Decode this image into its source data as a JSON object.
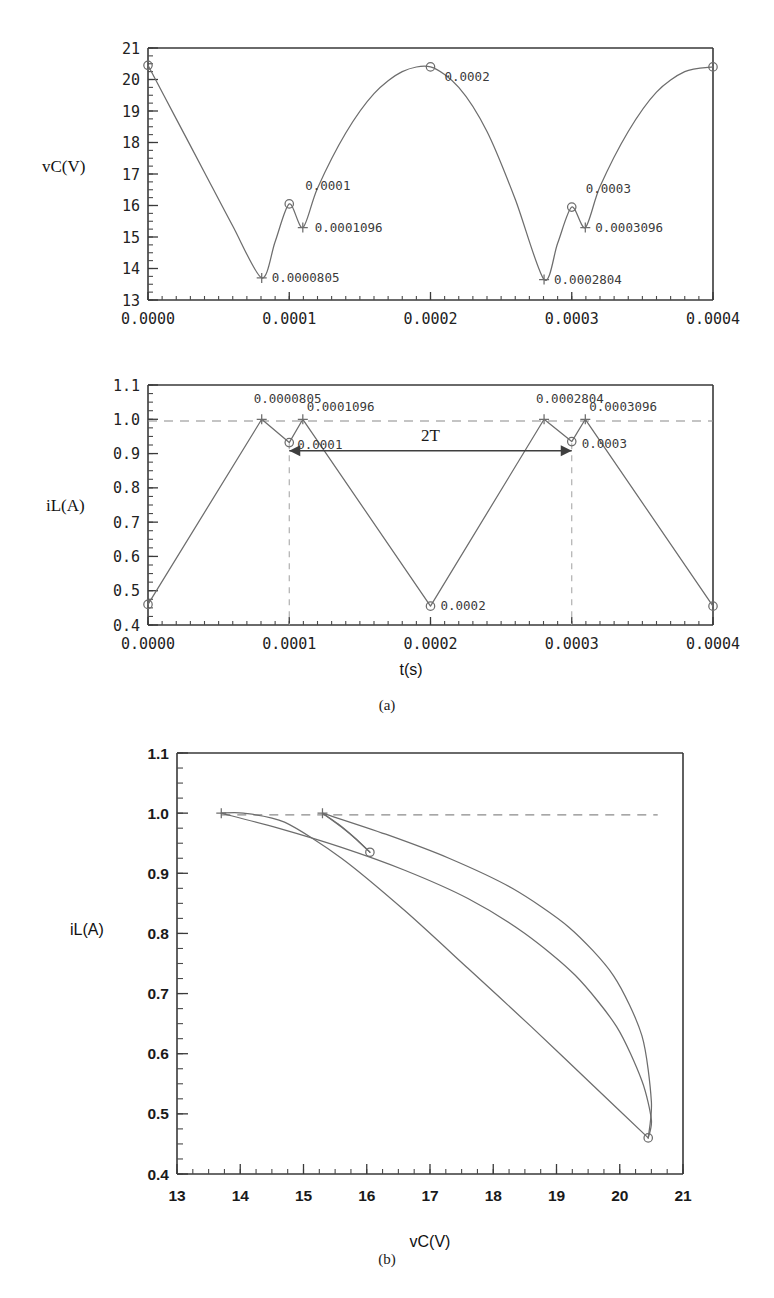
{
  "figure": {
    "captions": [
      {
        "id": "caption-a",
        "text": "(a)"
      },
      {
        "id": "caption-b",
        "text": "(b)"
      }
    ]
  },
  "chart_data": [
    {
      "id": "vc-time",
      "type": "line",
      "title": "",
      "xlabel": "",
      "ylabel": "vC(V)",
      "xlim": [
        0.0,
        0.0004
      ],
      "ylim": [
        13,
        21
      ],
      "grid": false,
      "legend": "none",
      "xticks": [
        "0.0000",
        "0.0001",
        "0.0002",
        "0.0003",
        "0.0004"
      ],
      "xtick_values": [
        0.0,
        0.0001,
        0.0002,
        0.0003,
        0.0004
      ],
      "yticks": [
        "13",
        "14",
        "15",
        "16",
        "17",
        "18",
        "19",
        "20",
        "21"
      ],
      "ytick_values": [
        13,
        14,
        15,
        16,
        17,
        18,
        19,
        20,
        21
      ],
      "x": [
        0.0,
        2e-05,
        4e-05,
        6e-05,
        8.05e-05,
        9e-05,
        0.0001,
        0.0001096,
        0.00012,
        0.00014,
        0.00016,
        0.00018,
        0.0002,
        0.00022,
        0.00024,
        0.00026,
        0.0002804,
        0.00029,
        0.0003,
        0.0003096,
        0.00032,
        0.00034,
        0.00036,
        0.00038,
        0.0004
      ],
      "y": [
        20.45,
        18.75,
        17.05,
        15.35,
        13.7,
        14.85,
        16.05,
        15.3,
        16.55,
        18.3,
        19.55,
        20.25,
        20.4,
        19.75,
        18.35,
        16.2,
        13.65,
        14.8,
        15.95,
        15.3,
        16.6,
        18.35,
        19.6,
        20.25,
        20.4
      ],
      "annotations": [
        {
          "label": "0.0001",
          "x": 0.0001,
          "y": 16.05,
          "marker": "circle",
          "label_dx": 16,
          "label_dy": -14
        },
        {
          "label": "0.0001096",
          "x": 0.0001096,
          "y": 15.3,
          "marker": "plus",
          "label_dx": 12,
          "label_dy": 4
        },
        {
          "label": "0.0000805",
          "x": 8.05e-05,
          "y": 13.7,
          "marker": "plus",
          "label_dx": 10,
          "label_dy": 4
        },
        {
          "label": "0.0002",
          "x": 0.0002,
          "y": 20.4,
          "marker": "circle",
          "label_dx": 14,
          "label_dy": 14
        },
        {
          "label": "0.0003",
          "x": 0.0003,
          "y": 15.95,
          "marker": "circle",
          "label_dx": 14,
          "label_dy": -14
        },
        {
          "label": "0.0003096",
          "x": 0.0003096,
          "y": 15.3,
          "marker": "plus",
          "label_dx": 10,
          "label_dy": 4
        },
        {
          "label": "0.0002804",
          "x": 0.0002804,
          "y": 13.65,
          "marker": "plus",
          "label_dx": 10,
          "label_dy": 4
        }
      ],
      "start_marker": {
        "x": 0.0,
        "y": 20.45,
        "marker": "circle"
      },
      "end_marker": {
        "x": 0.0004,
        "y": 20.4,
        "marker": "circle"
      }
    },
    {
      "id": "il-time",
      "type": "line",
      "title": "",
      "xlabel": "t(s)",
      "ylabel": "iL(A)",
      "xlim": [
        0.0,
        0.0004
      ],
      "ylim": [
        0.4,
        1.1
      ],
      "grid": false,
      "legend": "none",
      "xticks": [
        "0.0000",
        "0.0001",
        "0.0002",
        "0.0003",
        "0.0004"
      ],
      "xtick_values": [
        0.0,
        0.0001,
        0.0002,
        0.0003,
        0.0004
      ],
      "yticks": [
        "0.4",
        "0.5",
        "0.6",
        "0.7",
        "0.8",
        "0.9",
        "1.0",
        "1.1"
      ],
      "ytick_values": [
        0.4,
        0.5,
        0.6,
        0.7,
        0.8,
        0.9,
        1.0,
        1.1
      ],
      "x": [
        0.0,
        8.05e-05,
        0.0001,
        0.0001096,
        0.0002,
        0.0002804,
        0.0003,
        0.0003096,
        0.0004
      ],
      "y": [
        0.46,
        1.0,
        0.932,
        1.0,
        0.455,
        1.0,
        0.935,
        1.0,
        0.455
      ],
      "reference_line": {
        "y": 0.995,
        "style": "dashed"
      },
      "vertical_guides": [
        0.0001,
        0.0003
      ],
      "annotations": [
        {
          "label": "0.0000805",
          "x": 8.05e-05,
          "y": 1.0,
          "marker": "plus",
          "label_dx": -8,
          "label_dy": -16
        },
        {
          "label": "0.0001096",
          "x": 0.0001096,
          "y": 1.0,
          "marker": "plus",
          "label_dx": 4,
          "label_dy": -8
        },
        {
          "label": "0.0001",
          "x": 0.0001,
          "y": 0.932,
          "marker": "circle",
          "label_dx": 8,
          "label_dy": 6
        },
        {
          "label": "0.0002",
          "x": 0.0002,
          "y": 0.455,
          "marker": "circle",
          "label_dx": 10,
          "label_dy": 4
        },
        {
          "label": "0.0002804",
          "x": 0.0002804,
          "y": 1.0,
          "marker": "plus",
          "label_dx": -8,
          "label_dy": -16
        },
        {
          "label": "0.0003096",
          "x": 0.0003096,
          "y": 1.0,
          "marker": "plus",
          "label_dx": 4,
          "label_dy": -8
        },
        {
          "label": "0.0003",
          "x": 0.0003,
          "y": 0.935,
          "marker": "circle",
          "label_dx": 10,
          "label_dy": 6
        }
      ],
      "span_annotation": {
        "label": "2T",
        "x_start": 0.0001,
        "x_end": 0.0003,
        "y": 0.908,
        "arrows": "both"
      },
      "start_marker": {
        "x": 0.0,
        "y": 0.46,
        "marker": "circle"
      },
      "end_marker": {
        "x": 0.0004,
        "y": 0.455,
        "marker": "circle"
      }
    },
    {
      "id": "phase-portrait",
      "type": "line",
      "title": "",
      "xlabel": "vC(V)",
      "ylabel": "iL(A)",
      "xlim": [
        13,
        21
      ],
      "ylim": [
        0.4,
        1.1
      ],
      "grid": false,
      "legend": "none",
      "xticks": [
        "13",
        "14",
        "15",
        "16",
        "17",
        "18",
        "19",
        "20",
        "21"
      ],
      "xtick_values": [
        13,
        14,
        15,
        16,
        17,
        18,
        19,
        20,
        21
      ],
      "yticks": [
        "0.4",
        "0.5",
        "0.6",
        "0.7",
        "0.8",
        "0.9",
        "1.0",
        "1.1"
      ],
      "ytick_values": [
        0.4,
        0.5,
        0.6,
        0.7,
        0.8,
        0.9,
        1.0,
        1.1
      ],
      "reference_line": {
        "y": 0.997,
        "x_start": 13.7,
        "x_end": 20.6,
        "style": "dashed"
      },
      "series": [
        {
          "name": "charge-ramp",
          "comment": "rising ramp from low-iL corner back up to vC=13.7 at iL=1.0",
          "x": [
            20.45,
            19.6,
            18.6,
            17.6,
            16.6,
            15.6,
            14.7,
            14.05,
            13.7
          ],
          "y": [
            0.46,
            0.545,
            0.645,
            0.742,
            0.838,
            0.925,
            0.985,
            1.0,
            1.0
          ]
        },
        {
          "name": "discharge-arc",
          "comment": "long curved discharge from vC=13.7,iL=1.0 out to vC=20.45,iL=0.46",
          "x": [
            13.7,
            14.6,
            15.6,
            16.6,
            17.6,
            18.5,
            19.3,
            19.95,
            20.35,
            20.5,
            20.45
          ],
          "y": [
            1.0,
            0.975,
            0.943,
            0.905,
            0.858,
            0.8,
            0.73,
            0.645,
            0.555,
            0.49,
            0.46
          ]
        },
        {
          "name": "small-loop-down",
          "comment": "short segment from vC=15.3,iL=1.0 down to vC=16.05,iL=0.935",
          "x": [
            15.3,
            15.6,
            15.85,
            16.05
          ],
          "y": [
            1.0,
            0.977,
            0.955,
            0.935
          ]
        },
        {
          "name": "small-loop-up",
          "comment": "short return from vC=16.05,iL=0.935 back to vC=15.3,iL=1.0",
          "x": [
            16.05,
            15.8,
            15.55,
            15.3
          ],
          "y": [
            0.935,
            0.96,
            0.982,
            1.0
          ]
        },
        {
          "name": "outer-return",
          "comment": "curve leaving vC=15.3,iL=1.0 toward the right descending branch",
          "x": [
            15.3,
            16.3,
            17.3,
            18.3,
            19.2,
            19.9,
            20.35,
            20.5,
            20.45
          ],
          "y": [
            1.0,
            0.965,
            0.925,
            0.875,
            0.81,
            0.73,
            0.63,
            0.52,
            0.46
          ]
        }
      ],
      "markers": [
        {
          "x": 13.7,
          "y": 1.0,
          "marker": "plus"
        },
        {
          "x": 15.3,
          "y": 1.0,
          "marker": "plus"
        },
        {
          "x": 16.05,
          "y": 0.935,
          "marker": "circle"
        },
        {
          "x": 20.45,
          "y": 0.46,
          "marker": "circle"
        }
      ]
    }
  ]
}
